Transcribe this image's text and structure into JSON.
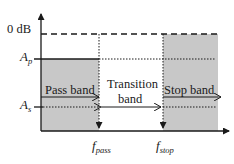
{
  "diagram": {
    "y_axis_labels": {
      "zero_db": "0 dB",
      "ap_main": "A",
      "ap_sub": "p",
      "as_main": "A",
      "as_sub": "s"
    },
    "x_axis_labels": {
      "fpass_main": "f",
      "fpass_sub": "pass",
      "fstop_main": "f",
      "fstop_sub": "stop"
    },
    "regions": {
      "pass_band": "Pass band",
      "transition_line1": "Transition",
      "transition_line2": "band",
      "stop_band": "Stop band"
    },
    "colors": {
      "shade": "#c8c8c8",
      "line": "#1a1a1a",
      "background": "#ffffff"
    }
  }
}
